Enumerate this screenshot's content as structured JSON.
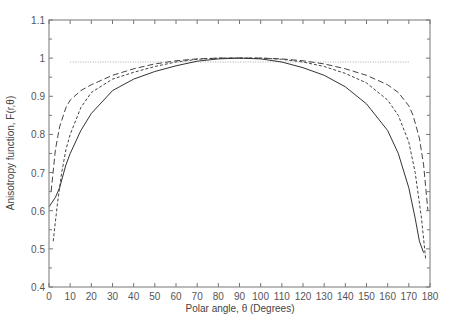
{
  "chart_data": {
    "type": "line",
    "title": "",
    "xlabel": "Polar angle, θ (Degrees)",
    "ylabel": "Anisotropy function, F(r,θ)",
    "xlim": [
      0,
      180
    ],
    "ylim": [
      0.4,
      1.1
    ],
    "xticks": [
      0,
      10,
      20,
      30,
      40,
      50,
      60,
      70,
      80,
      90,
      100,
      110,
      120,
      130,
      140,
      150,
      160,
      170,
      180
    ],
    "yticks": [
      0.4,
      0.5,
      0.6,
      0.7,
      0.8,
      0.9,
      1,
      1.1
    ],
    "ytick_labels": [
      "0.4",
      "0.5",
      "0.6",
      "0.7",
      "0.8",
      "0.9",
      "1",
      "1.1"
    ],
    "grid": false,
    "legend": null,
    "series": [
      {
        "name": "dotted",
        "style": "dotted",
        "color": "#aaaaaa",
        "x": [
          10,
          170
        ],
        "y": [
          0.99,
          0.99
        ]
      },
      {
        "name": "long-dash",
        "style": "long-dash",
        "color": "#444444",
        "x": [
          1,
          3,
          5,
          8,
          10,
          15,
          20,
          30,
          40,
          50,
          60,
          70,
          80,
          90,
          100,
          110,
          120,
          130,
          140,
          150,
          160,
          165,
          170,
          172,
          175,
          177,
          179
        ],
        "y": [
          0.65,
          0.76,
          0.82,
          0.87,
          0.89,
          0.915,
          0.93,
          0.955,
          0.972,
          0.985,
          0.993,
          0.998,
          1.0,
          1.0,
          1.0,
          0.998,
          0.993,
          0.985,
          0.972,
          0.955,
          0.93,
          0.91,
          0.875,
          0.85,
          0.79,
          0.72,
          0.6
        ]
      },
      {
        "name": "short-dash",
        "style": "short-dash",
        "color": "#444444",
        "x": [
          2,
          4,
          6,
          8,
          10,
          15,
          20,
          30,
          40,
          50,
          60,
          70,
          80,
          90,
          100,
          110,
          120,
          130,
          140,
          150,
          160,
          165,
          170,
          173,
          176,
          178
        ],
        "y": [
          0.52,
          0.62,
          0.7,
          0.76,
          0.8,
          0.87,
          0.91,
          0.945,
          0.963,
          0.978,
          0.99,
          0.997,
          1.0,
          1.0,
          1.0,
          0.997,
          0.99,
          0.978,
          0.96,
          0.935,
          0.89,
          0.85,
          0.78,
          0.7,
          0.58,
          0.47
        ]
      },
      {
        "name": "solid",
        "style": "solid",
        "color": "#333333",
        "x": [
          0,
          3,
          5,
          8,
          10,
          15,
          20,
          30,
          40,
          50,
          60,
          70,
          80,
          90,
          100,
          110,
          120,
          130,
          140,
          150,
          160,
          165,
          170,
          173,
          175,
          177
        ],
        "y": [
          0.61,
          0.635,
          0.66,
          0.72,
          0.75,
          0.81,
          0.855,
          0.915,
          0.945,
          0.965,
          0.98,
          0.992,
          0.998,
          1.0,
          0.998,
          0.99,
          0.975,
          0.955,
          0.925,
          0.88,
          0.81,
          0.75,
          0.66,
          0.58,
          0.52,
          0.49
        ]
      }
    ]
  },
  "axes": {
    "xlabel": "Polar angle, θ (Degrees)",
    "ylabel": "Anisotropy function, F(r,θ)"
  }
}
